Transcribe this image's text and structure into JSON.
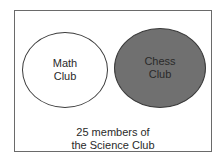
{
  "diagram": {
    "type": "venn",
    "universe": {
      "caption": "25 members of\nthe Science Club",
      "border_color": "#6a6a6a"
    },
    "sets": [
      {
        "label": "Math\nClub",
        "fill": "#ffffff"
      },
      {
        "label": "Chess\nClub",
        "fill": "#707070"
      }
    ],
    "overlap": false
  }
}
